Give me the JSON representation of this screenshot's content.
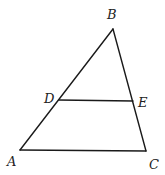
{
  "diagram": {
    "type": "geometry-triangle",
    "points": {
      "A": {
        "label": "A",
        "x": 20,
        "y": 150,
        "label_x": 7,
        "label_y": 166
      },
      "B": {
        "label": "B",
        "x": 113,
        "y": 29,
        "label_x": 107,
        "label_y": 19
      },
      "C": {
        "label": "C",
        "x": 146,
        "y": 151,
        "label_x": 149,
        "label_y": 169
      },
      "D": {
        "label": "D",
        "x": 59,
        "y": 100,
        "label_x": 44,
        "label_y": 103
      },
      "E": {
        "label": "E",
        "x": 133,
        "y": 101,
        "label_x": 138,
        "label_y": 107
      }
    },
    "segments": [
      {
        "from": "A",
        "to": "B"
      },
      {
        "from": "B",
        "to": "C"
      },
      {
        "from": "A",
        "to": "C"
      },
      {
        "from": "D",
        "to": "E"
      }
    ],
    "colors": {
      "stroke": "#1a1a1a",
      "label": "#222222",
      "background": "#ffffff"
    }
  }
}
